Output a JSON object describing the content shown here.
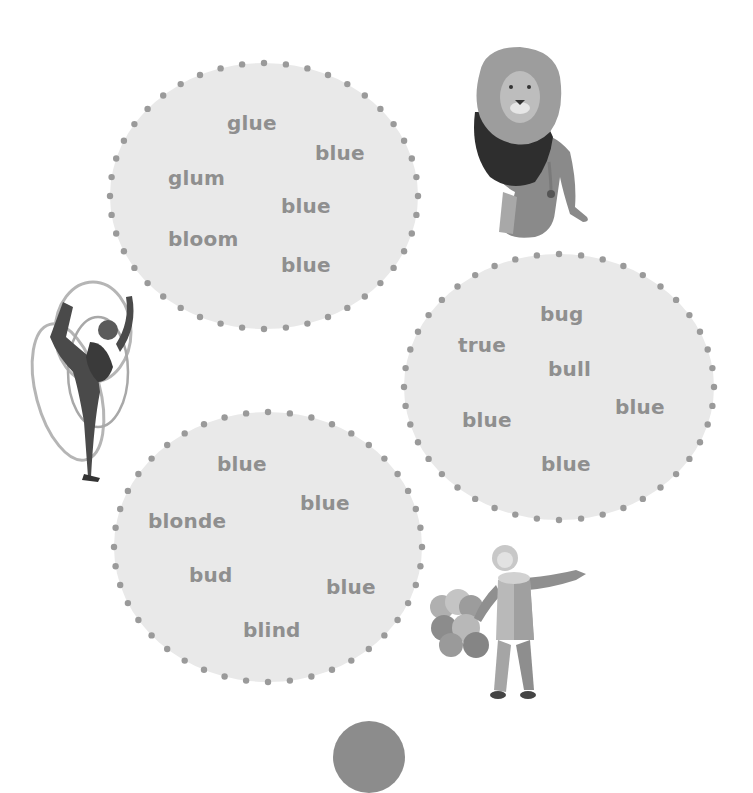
{
  "colors": {
    "background": "#ffffff",
    "bubble_fill": "#e9e9e9",
    "dot": "#9a9a9a",
    "word_text": "#8f8f8f",
    "bottom_tab": "#8c8c8c"
  },
  "bubbles": [
    {
      "id": "bubble-1",
      "center": [
        264,
        196
      ],
      "rx": 154,
      "ry": 133,
      "dots": 44,
      "words": [
        {
          "text": "glue",
          "x": 227,
          "y": 113
        },
        {
          "text": "blue",
          "x": 315,
          "y": 143
        },
        {
          "text": "glum",
          "x": 168,
          "y": 168
        },
        {
          "text": "blue",
          "x": 281,
          "y": 196
        },
        {
          "text": "bloom",
          "x": 168,
          "y": 229
        },
        {
          "text": "blue",
          "x": 281,
          "y": 255
        }
      ]
    },
    {
      "id": "bubble-2",
      "center": [
        559,
        387
      ],
      "rx": 155,
      "ry": 133,
      "dots": 44,
      "words": [
        {
          "text": "bug",
          "x": 540,
          "y": 304
        },
        {
          "text": "true",
          "x": 458,
          "y": 335
        },
        {
          "text": "bull",
          "x": 548,
          "y": 359
        },
        {
          "text": "blue",
          "x": 615,
          "y": 397
        },
        {
          "text": "blue",
          "x": 462,
          "y": 410
        },
        {
          "text": "blue",
          "x": 541,
          "y": 454
        }
      ]
    },
    {
      "id": "bubble-3",
      "center": [
        268,
        547
      ],
      "rx": 154,
      "ry": 135,
      "dots": 44,
      "words": [
        {
          "text": "blue",
          "x": 217,
          "y": 454
        },
        {
          "text": "blue",
          "x": 300,
          "y": 493
        },
        {
          "text": "blonde",
          "x": 148,
          "y": 511
        },
        {
          "text": "bud",
          "x": 189,
          "y": 565
        },
        {
          "text": "blue",
          "x": 326,
          "y": 577
        },
        {
          "text": "blind",
          "x": 243,
          "y": 620
        }
      ]
    }
  ],
  "images": [
    {
      "name": "lion",
      "label": "lion"
    },
    {
      "name": "gymnast",
      "label": "rhythmic gymnast with ribbon"
    },
    {
      "name": "clown",
      "label": "clown with balloons"
    }
  ]
}
